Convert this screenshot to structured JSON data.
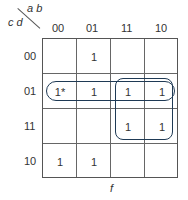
{
  "kmap": {
    "row_var_label": "c d",
    "col_var_label": "a b",
    "col_headers": [
      "00",
      "01",
      "11",
      "10"
    ],
    "row_headers": [
      "00",
      "01",
      "11",
      "10"
    ],
    "cells": [
      [
        "",
        "1",
        "",
        ""
      ],
      [
        "1*",
        "1",
        "1",
        "1"
      ],
      [
        "",
        "",
        "1",
        "1"
      ],
      [
        "1",
        "1",
        "",
        ""
      ]
    ],
    "function_label": "f",
    "groups": [
      {
        "name": "row-01-group",
        "cells": "row 01, columns 00-10"
      },
      {
        "name": "quad-group",
        "cells": "rows 01-11, columns 11-10"
      }
    ],
    "loop_color": "#1f3a55"
  }
}
